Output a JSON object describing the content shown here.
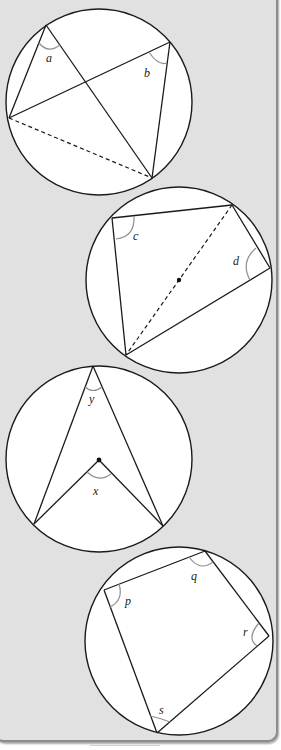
{
  "figure": {
    "background_color": "#e1e1e1",
    "border_color": "#8c8c8c",
    "line_color": "#1a1a1a",
    "angle_arc_color": "#8f8f8f",
    "diagrams": [
      {
        "id": "angles-in-same-segment",
        "description": "Two angles a and b subtended by the same chord (dashed)",
        "labels": {
          "a": "a",
          "b": "b"
        }
      },
      {
        "id": "angle-in-semicircle",
        "description": "Angles c and d in a semicircle; dashed diameter through the centre",
        "labels": {
          "c": "c",
          "d": "d"
        }
      },
      {
        "id": "angle-at-centre",
        "description": "Angle x at the centre and angle y at the circumference on the same arc",
        "labels": {
          "x": "x",
          "y": "y"
        }
      },
      {
        "id": "cyclic-quadrilateral",
        "description": "Cyclic quadrilateral with interior angles p, q, r, s",
        "labels": {
          "p": "p",
          "q": "q",
          "r": "r",
          "s": "s"
        }
      }
    ]
  }
}
